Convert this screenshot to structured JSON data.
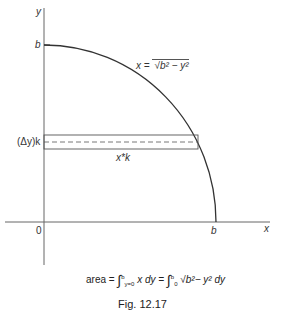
{
  "figure": {
    "caption": "Fig. 12.17",
    "axes": {
      "x_label": "x",
      "y_label": "y",
      "origin_label": "0",
      "x_intercept_label": "b",
      "y_intercept_label": "b"
    },
    "curve": {
      "equation_lhs": "x =",
      "equation_rhs": "√b² − y²",
      "description": "quarter circle of radius b in first quadrant"
    },
    "strip": {
      "height_label": "(Δy)k",
      "x_label": "x*k"
    },
    "formula": {
      "prefix": "area =",
      "int1_upper": "b",
      "int1_lower": "y=0",
      "int1_body": "x dy =",
      "int2_upper": "b",
      "int2_lower": "0",
      "int2_body": "√b²− y²  dy"
    }
  }
}
